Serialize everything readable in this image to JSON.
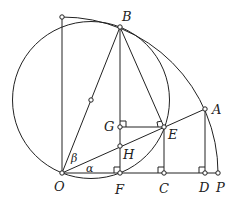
{
  "diagram": {
    "type": "geometry",
    "points": {
      "O": {
        "label": "O",
        "x": 62,
        "y": 173
      },
      "T": {
        "label": "",
        "x": 62,
        "y": 17
      },
      "B": {
        "label": "B",
        "x": 120,
        "y": 27
      },
      "M": {
        "label": "",
        "x": 91,
        "y": 100
      },
      "G": {
        "label": "G",
        "x": 120,
        "y": 127
      },
      "H": {
        "label": "H",
        "x": 120,
        "y": 146
      },
      "E": {
        "label": "E",
        "x": 164,
        "y": 127
      },
      "A": {
        "label": "A",
        "x": 205,
        "y": 109
      },
      "F": {
        "label": "F",
        "x": 120,
        "y": 173
      },
      "C": {
        "label": "C",
        "x": 164,
        "y": 173
      },
      "D": {
        "label": "D",
        "x": 205,
        "y": 173
      },
      "P": {
        "label": "P",
        "x": 218,
        "y": 173
      }
    },
    "angles": {
      "alpha": "α",
      "beta": "β"
    },
    "labels": {
      "O": "O",
      "B": "B",
      "G": "G",
      "H": "H",
      "E": "E",
      "A": "A",
      "F": "F",
      "C": "C",
      "D": "D",
      "P": "P"
    }
  }
}
